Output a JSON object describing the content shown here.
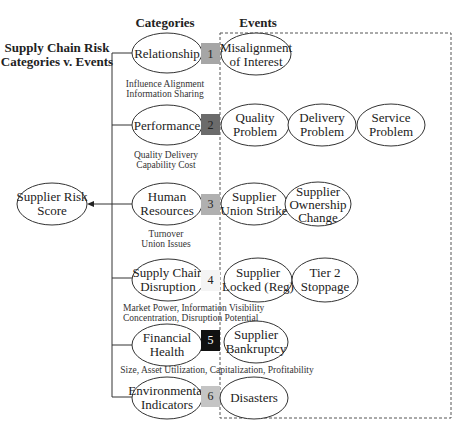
{
  "title": {
    "line1": "Supply Chain Risk",
    "line2": "Categories v. Events"
  },
  "headers": {
    "categories": "Categories",
    "events": "Events"
  },
  "score": {
    "line1": "Supplier Risk",
    "line2": "Score"
  },
  "categories": [
    {
      "number": "1",
      "box_color": "#a6a6a6",
      "label_lines": [
        "Relationship"
      ],
      "sub_lines": [
        "Influence Alignment",
        "Information Sharing"
      ],
      "events": [
        {
          "lines": [
            "Misalignment",
            "of Interest"
          ]
        }
      ]
    },
    {
      "number": "2",
      "box_color": "#6b6b6b",
      "label_lines": [
        "Performance"
      ],
      "sub_lines": [
        "Quality Delivery",
        "Capability Cost"
      ],
      "events": [
        {
          "lines": [
            "Quality",
            "Problem"
          ]
        },
        {
          "lines": [
            "Delivery",
            "Problem"
          ]
        },
        {
          "lines": [
            "Service",
            "Problem"
          ]
        }
      ]
    },
    {
      "number": "3",
      "box_color": "#b0b0b0",
      "label_lines": [
        "Human",
        "Resources"
      ],
      "sub_lines": [
        "Turnover",
        "Union Issues"
      ],
      "events": [
        {
          "lines": [
            "Supplier",
            "Union Strike"
          ]
        },
        {
          "lines": [
            "Supplier",
            "Ownership",
            "Change"
          ]
        }
      ]
    },
    {
      "number": "4",
      "box_color": "#f4f4f4",
      "label_lines": [
        "Supply Chain",
        "Disruption"
      ],
      "sub_lines": [
        "Market Power, Information Visibility",
        "Concentration, Disruption Potential"
      ],
      "events": [
        {
          "lines": [
            "Supplier",
            "Locked (Reg)"
          ]
        },
        {
          "lines": [
            "Tier 2",
            "Stoppage"
          ]
        }
      ]
    },
    {
      "number": "5",
      "box_color": "#111111",
      "label_lines": [
        "Financial",
        "Health"
      ],
      "sub_lines": [
        "Size, Asset Utilization, Capitalization, Profitability"
      ],
      "events": [
        {
          "lines": [
            "Supplier",
            "Bankruptcy"
          ]
        }
      ]
    },
    {
      "number": "6",
      "box_color": "#c4c4c4",
      "label_lines": [
        "Environmental",
        "Indicators"
      ],
      "sub_lines": [],
      "events": [
        {
          "lines": [
            "Disasters"
          ]
        }
      ]
    }
  ]
}
